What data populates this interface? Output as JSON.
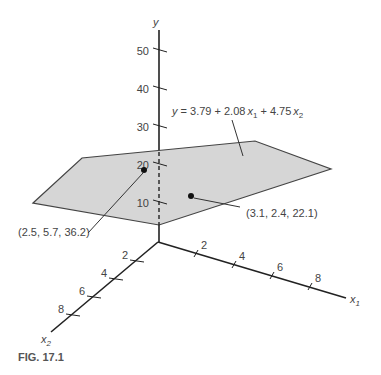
{
  "figure": {
    "caption": "FIG. 17.1",
    "plane_equation": "y = 3.79 + 2.08x₁ + 4.75x₂",
    "eq": {
      "y": "y",
      "rest": " = 3.79 + 2.08",
      "x1": "x",
      "sub1": "1",
      "plus": " + 4.75",
      "x2": "x",
      "sub2": "2"
    },
    "plane_fill": "#d6d6d6",
    "axes": {
      "y": {
        "label": "y",
        "ticks": [
          "10",
          "20",
          "30",
          "40",
          "50"
        ]
      },
      "x1": {
        "label": "x",
        "sub": "1",
        "ticks": [
          "2",
          "4",
          "6",
          "8"
        ]
      },
      "x2": {
        "label": "x",
        "sub": "2",
        "ticks": [
          "2",
          "4",
          "6",
          "8"
        ]
      }
    },
    "points": [
      {
        "label": "(2.5, 5.7, 36.2)",
        "x1": 2.5,
        "x2": 5.7,
        "y": 36.2
      },
      {
        "label": "(3.1, 2.4, 22.1)",
        "x1": 3.1,
        "x2": 2.4,
        "y": 22.1
      }
    ]
  }
}
